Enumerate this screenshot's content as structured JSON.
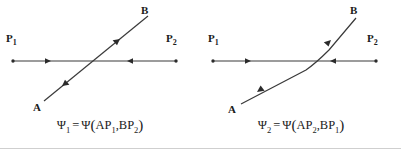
{
  "figure": {
    "background_color": "#ffffff",
    "line_color": "#3a3a3a",
    "text_color": "#1b1b1b",
    "bottom_rule_color": "#cfcfcf"
  },
  "panels": [
    {
      "id": "left",
      "name": "psi-1-diagram",
      "labels": {
        "p1": "P",
        "p1_sub": "1",
        "p2": "P",
        "p2_sub": "2",
        "a": "A",
        "b": "B"
      },
      "crossing_style": "sharp-x",
      "caption": {
        "psi": "Ψ",
        "psi_sub": "1",
        "equals": "=",
        "func": "Ψ",
        "open": "(",
        "arg1": "AP",
        "arg1_sub": "1",
        "comma": ",",
        "arg2": "BP",
        "arg2_sub": "2",
        "close": ")",
        "plain": "Ψ₁ = Ψ(AP₁, BP₂)"
      }
    },
    {
      "id": "right",
      "name": "psi-2-diagram",
      "labels": {
        "p1": "P",
        "p1_sub": "1",
        "p2": "P",
        "p2_sub": "2",
        "a": "A",
        "b": "B"
      },
      "crossing_style": "smooth-tangential",
      "caption": {
        "psi": "Ψ",
        "psi_sub": "2",
        "equals": "=",
        "func": "Ψ",
        "open": "(",
        "arg1": "AP",
        "arg1_sub": "2",
        "comma": ",",
        "arg2": "BP",
        "arg2_sub": "1",
        "close": ")",
        "plain": "Ψ₂ = Ψ(AP₂, BP₁)"
      }
    }
  ]
}
